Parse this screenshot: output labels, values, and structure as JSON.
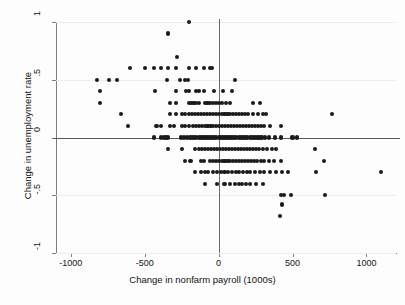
{
  "chart_data": {
    "type": "scatter",
    "title": "",
    "xlabel": "Change in nonfarm payroll (1000s)",
    "ylabel": "Change in unemployment rate",
    "xlim": [
      -1100,
      1200
    ],
    "ylim": [
      -1.0,
      1.0
    ],
    "xticks": [
      -1000,
      -500,
      0,
      500,
      1000
    ],
    "xticklabels": [
      "-1000",
      "-500",
      "0",
      "500",
      "1000"
    ],
    "yticks": [
      1,
      0.5,
      0,
      -0.5,
      -1
    ],
    "yticklabels": [
      "1",
      ".5",
      "0",
      "-.5",
      "-1"
    ],
    "grid": "horizontal-light",
    "legend": "none",
    "reference_lines": [
      {
        "axis": "y",
        "value": 0
      },
      {
        "axis": "x",
        "value": 0
      }
    ],
    "marker": {
      "shape": "circle",
      "color": "#1a1a1a",
      "size_px": 4.2
    },
    "points": [
      [
        -200,
        1.0
      ],
      [
        -340,
        0.9
      ],
      [
        -280,
        0.7
      ],
      [
        -600,
        0.6
      ],
      [
        -500,
        0.6
      ],
      [
        -440,
        0.6
      ],
      [
        -390,
        0.6
      ],
      [
        -340,
        0.6
      ],
      [
        -290,
        0.6
      ],
      [
        -200,
        0.6
      ],
      [
        -150,
        0.6
      ],
      [
        -100,
        0.6
      ],
      [
        -60,
        0.6
      ],
      [
        -45,
        0.6
      ],
      [
        -820,
        0.5
      ],
      [
        -740,
        0.5
      ],
      [
        -690,
        0.5
      ],
      [
        -350,
        0.5
      ],
      [
        -260,
        0.5
      ],
      [
        -230,
        0.5
      ],
      [
        -210,
        0.5
      ],
      [
        110,
        0.5
      ],
      [
        -800,
        0.4
      ],
      [
        -430,
        0.4
      ],
      [
        -290,
        0.4
      ],
      [
        -220,
        0.4
      ],
      [
        -200,
        0.4
      ],
      [
        -150,
        0.4
      ],
      [
        -130,
        0.4
      ],
      [
        -100,
        0.4
      ],
      [
        -30,
        0.4
      ],
      [
        30,
        0.4
      ],
      [
        90,
        0.4
      ],
      [
        -800,
        0.3
      ],
      [
        -330,
        0.3
      ],
      [
        -290,
        0.3
      ],
      [
        -200,
        0.3
      ],
      [
        -185,
        0.3
      ],
      [
        -170,
        0.3
      ],
      [
        -155,
        0.3
      ],
      [
        -130,
        0.3
      ],
      [
        -95,
        0.3
      ],
      [
        -75,
        0.3
      ],
      [
        -60,
        0.3
      ],
      [
        -40,
        0.3
      ],
      [
        -20,
        0.3
      ],
      [
        5,
        0.3
      ],
      [
        25,
        0.3
      ],
      [
        50,
        0.3
      ],
      [
        75,
        0.3
      ],
      [
        230,
        0.3
      ],
      [
        280,
        0.3
      ],
      [
        -660,
        0.2
      ],
      [
        -330,
        0.2
      ],
      [
        -290,
        0.2
      ],
      [
        -250,
        0.2
      ],
      [
        -225,
        0.2
      ],
      [
        -200,
        0.2
      ],
      [
        -180,
        0.2
      ],
      [
        -160,
        0.2
      ],
      [
        -140,
        0.2
      ],
      [
        -120,
        0.2
      ],
      [
        -100,
        0.2
      ],
      [
        -80,
        0.2
      ],
      [
        -60,
        0.2
      ],
      [
        -40,
        0.2
      ],
      [
        -20,
        0.2
      ],
      [
        0,
        0.2
      ],
      [
        20,
        0.2
      ],
      [
        40,
        0.2
      ],
      [
        60,
        0.2
      ],
      [
        80,
        0.2
      ],
      [
        100,
        0.2
      ],
      [
        120,
        0.2
      ],
      [
        140,
        0.2
      ],
      [
        160,
        0.2
      ],
      [
        180,
        0.2
      ],
      [
        200,
        0.2
      ],
      [
        230,
        0.2
      ],
      [
        265,
        0.2
      ],
      [
        300,
        0.2
      ],
      [
        320,
        0.2
      ],
      [
        770,
        0.2
      ],
      [
        -610,
        0.1
      ],
      [
        -420,
        0.1
      ],
      [
        -390,
        0.1
      ],
      [
        -330,
        0.1
      ],
      [
        -300,
        0.1
      ],
      [
        -250,
        0.1
      ],
      [
        -225,
        0.1
      ],
      [
        -200,
        0.1
      ],
      [
        -175,
        0.1
      ],
      [
        -155,
        0.1
      ],
      [
        -135,
        0.1
      ],
      [
        -115,
        0.1
      ],
      [
        -95,
        0.1
      ],
      [
        -75,
        0.1
      ],
      [
        -55,
        0.1
      ],
      [
        -35,
        0.1
      ],
      [
        -15,
        0.1
      ],
      [
        5,
        0.1
      ],
      [
        25,
        0.1
      ],
      [
        45,
        0.1
      ],
      [
        65,
        0.1
      ],
      [
        85,
        0.1
      ],
      [
        105,
        0.1
      ],
      [
        125,
        0.1
      ],
      [
        145,
        0.1
      ],
      [
        165,
        0.1
      ],
      [
        185,
        0.1
      ],
      [
        205,
        0.1
      ],
      [
        225,
        0.1
      ],
      [
        245,
        0.1
      ],
      [
        265,
        0.1
      ],
      [
        285,
        0.1
      ],
      [
        310,
        0.1
      ],
      [
        345,
        0.1
      ],
      [
        420,
        0.1
      ],
      [
        -440,
        0.0
      ],
      [
        -390,
        0.0
      ],
      [
        -370,
        0.0
      ],
      [
        -355,
        0.0
      ],
      [
        -340,
        0.0
      ],
      [
        -255,
        0.0
      ],
      [
        -235,
        0.0
      ],
      [
        -215,
        0.0
      ],
      [
        -195,
        0.0
      ],
      [
        -180,
        0.0
      ],
      [
        -165,
        0.0
      ],
      [
        -150,
        0.0
      ],
      [
        -135,
        0.0
      ],
      [
        -120,
        0.0
      ],
      [
        -105,
        0.0
      ],
      [
        -90,
        0.0
      ],
      [
        -75,
        0.0
      ],
      [
        -60,
        0.0
      ],
      [
        -45,
        0.0
      ],
      [
        -30,
        0.0
      ],
      [
        -15,
        0.0
      ],
      [
        0,
        0.0
      ],
      [
        15,
        0.0
      ],
      [
        30,
        0.0
      ],
      [
        45,
        0.0
      ],
      [
        60,
        0.0
      ],
      [
        75,
        0.0
      ],
      [
        90,
        0.0
      ],
      [
        105,
        0.0
      ],
      [
        120,
        0.0
      ],
      [
        135,
        0.0
      ],
      [
        150,
        0.0
      ],
      [
        165,
        0.0
      ],
      [
        180,
        0.0
      ],
      [
        195,
        0.0
      ],
      [
        210,
        0.0
      ],
      [
        225,
        0.0
      ],
      [
        240,
        0.0
      ],
      [
        255,
        0.0
      ],
      [
        270,
        0.0
      ],
      [
        290,
        0.0
      ],
      [
        315,
        0.0
      ],
      [
        340,
        0.0
      ],
      [
        380,
        0.0
      ],
      [
        420,
        0.0
      ],
      [
        500,
        0.0
      ],
      [
        530,
        0.0
      ],
      [
        -340,
        -0.1
      ],
      [
        -250,
        -0.1
      ],
      [
        -160,
        -0.1
      ],
      [
        -130,
        -0.1
      ],
      [
        -110,
        -0.1
      ],
      [
        -90,
        -0.1
      ],
      [
        -70,
        -0.1
      ],
      [
        -50,
        -0.1
      ],
      [
        -30,
        -0.1
      ],
      [
        -10,
        -0.1
      ],
      [
        10,
        -0.1
      ],
      [
        30,
        -0.1
      ],
      [
        50,
        -0.1
      ],
      [
        70,
        -0.1
      ],
      [
        90,
        -0.1
      ],
      [
        110,
        -0.1
      ],
      [
        130,
        -0.1
      ],
      [
        150,
        -0.1
      ],
      [
        170,
        -0.1
      ],
      [
        190,
        -0.1
      ],
      [
        210,
        -0.1
      ],
      [
        230,
        -0.1
      ],
      [
        250,
        -0.1
      ],
      [
        275,
        -0.1
      ],
      [
        300,
        -0.1
      ],
      [
        330,
        -0.1
      ],
      [
        360,
        -0.1
      ],
      [
        390,
        -0.1
      ],
      [
        650,
        -0.1
      ],
      [
        -230,
        -0.2
      ],
      [
        -190,
        -0.2
      ],
      [
        -120,
        -0.2
      ],
      [
        -100,
        -0.2
      ],
      [
        -60,
        -0.2
      ],
      [
        -40,
        -0.2
      ],
      [
        -20,
        -0.2
      ],
      [
        0,
        -0.2
      ],
      [
        20,
        -0.2
      ],
      [
        40,
        -0.2
      ],
      [
        60,
        -0.2
      ],
      [
        80,
        -0.2
      ],
      [
        100,
        -0.2
      ],
      [
        120,
        -0.2
      ],
      [
        140,
        -0.2
      ],
      [
        160,
        -0.2
      ],
      [
        180,
        -0.2
      ],
      [
        200,
        -0.2
      ],
      [
        220,
        -0.2
      ],
      [
        240,
        -0.2
      ],
      [
        260,
        -0.2
      ],
      [
        285,
        -0.2
      ],
      [
        310,
        -0.2
      ],
      [
        340,
        -0.2
      ],
      [
        375,
        -0.2
      ],
      [
        420,
        -0.2
      ],
      [
        710,
        -0.2
      ],
      [
        -160,
        -0.3
      ],
      [
        -120,
        -0.3
      ],
      [
        -90,
        -0.3
      ],
      [
        -70,
        -0.3
      ],
      [
        -40,
        -0.3
      ],
      [
        -10,
        -0.3
      ],
      [
        15,
        -0.3
      ],
      [
        40,
        -0.3
      ],
      [
        65,
        -0.3
      ],
      [
        90,
        -0.3
      ],
      [
        115,
        -0.3
      ],
      [
        140,
        -0.3
      ],
      [
        165,
        -0.3
      ],
      [
        190,
        -0.3
      ],
      [
        215,
        -0.3
      ],
      [
        245,
        -0.3
      ],
      [
        280,
        -0.3
      ],
      [
        310,
        -0.3
      ],
      [
        350,
        -0.3
      ],
      [
        390,
        -0.3
      ],
      [
        430,
        -0.3
      ],
      [
        470,
        -0.3
      ],
      [
        660,
        -0.3
      ],
      [
        1100,
        -0.3
      ],
      [
        -90,
        -0.4
      ],
      [
        -10,
        -0.4
      ],
      [
        40,
        -0.4
      ],
      [
        80,
        -0.4
      ],
      [
        110,
        -0.4
      ],
      [
        135,
        -0.4
      ],
      [
        160,
        -0.4
      ],
      [
        185,
        -0.4
      ],
      [
        215,
        -0.4
      ],
      [
        250,
        -0.4
      ],
      [
        300,
        -0.4
      ],
      [
        420,
        -0.5
      ],
      [
        440,
        -0.5
      ],
      [
        490,
        -0.5
      ],
      [
        720,
        -0.5
      ],
      [
        430,
        -0.58
      ],
      [
        415,
        -0.68
      ]
    ]
  }
}
